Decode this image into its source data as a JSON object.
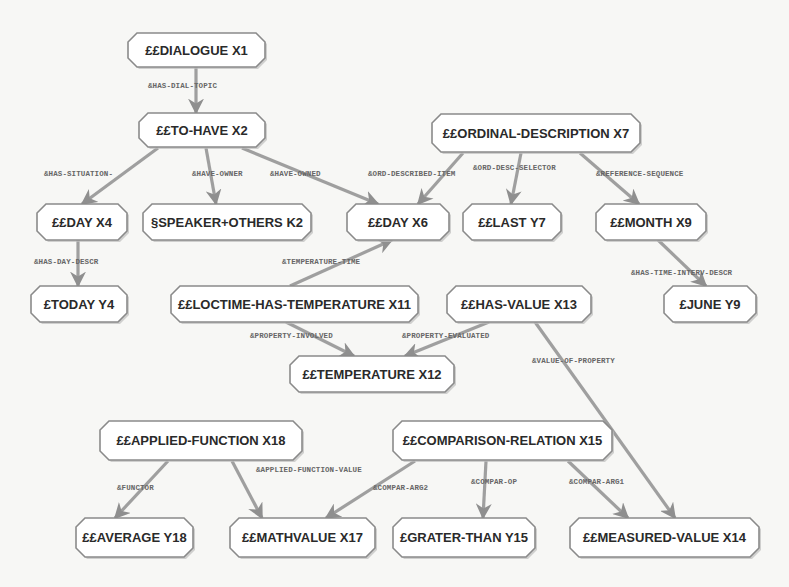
{
  "diagram": {
    "colors": {
      "background": "#f7f7f5",
      "node_fill": "#ffffff",
      "node_border": "#8a8a8a",
      "node_shadow": "#bdbdbd",
      "edge": "#8f8f8f",
      "node_text": "#2a2a2a",
      "edge_label_text": "#666666"
    },
    "nodes": [
      {
        "id": "X1",
        "label": "££DIALOGUE X1",
        "x": 128,
        "y": 33,
        "w": 137,
        "h": 34
      },
      {
        "id": "X2",
        "label": "££TO-HAVE X2",
        "x": 139,
        "y": 113,
        "w": 126,
        "h": 34
      },
      {
        "id": "X7",
        "label": "££ORDINAL-DESCRIPTION X7",
        "x": 432,
        "y": 114,
        "w": 208,
        "h": 38
      },
      {
        "id": "X4",
        "label": "££DAY X4",
        "x": 37,
        "y": 204,
        "w": 90,
        "h": 36
      },
      {
        "id": "K2",
        "label": "§SPEAKER+OTHERS K2",
        "x": 143,
        "y": 204,
        "w": 168,
        "h": 36
      },
      {
        "id": "X6",
        "label": "££DAY X6",
        "x": 347,
        "y": 204,
        "w": 102,
        "h": 36
      },
      {
        "id": "Y7",
        "label": "££LAST Y7",
        "x": 463,
        "y": 204,
        "w": 98,
        "h": 36
      },
      {
        "id": "X9",
        "label": "££MONTH X9",
        "x": 596,
        "y": 204,
        "w": 110,
        "h": 36
      },
      {
        "id": "Y4",
        "label": "£TODAY Y4",
        "x": 31,
        "y": 286,
        "w": 96,
        "h": 36
      },
      {
        "id": "X11",
        "label": "££LOCTIME-HAS-TEMPERATURE X11",
        "x": 171,
        "y": 286,
        "w": 247,
        "h": 36
      },
      {
        "id": "X13",
        "label": "££HAS-VALUE X13",
        "x": 447,
        "y": 286,
        "w": 144,
        "h": 36
      },
      {
        "id": "Y9",
        "label": "£JUNE Y9",
        "x": 664,
        "y": 286,
        "w": 92,
        "h": 36
      },
      {
        "id": "X12",
        "label": "££TEMPERATURE X12",
        "x": 290,
        "y": 356,
        "w": 164,
        "h": 36
      },
      {
        "id": "X18",
        "label": "££APPLIED-FUNCTION X18",
        "x": 100,
        "y": 421,
        "w": 202,
        "h": 39
      },
      {
        "id": "X15",
        "label": "££COMPARISON-RELATION X15",
        "x": 393,
        "y": 421,
        "w": 219,
        "h": 39
      },
      {
        "id": "Y18",
        "label": "££AVERAGE Y18",
        "x": 76,
        "y": 518,
        "w": 117,
        "h": 39
      },
      {
        "id": "X17",
        "label": "££MATHVALUE X17",
        "x": 230,
        "y": 518,
        "w": 145,
        "h": 39
      },
      {
        "id": "Y15",
        "label": "£GRATER-THAN Y15",
        "x": 393,
        "y": 518,
        "w": 142,
        "h": 39
      },
      {
        "id": "X14",
        "label": "££MEASURED-VALUE X14",
        "x": 570,
        "y": 518,
        "w": 189,
        "h": 39
      }
    ],
    "edges": [
      {
        "from": "X1",
        "to": "X2",
        "label": "&HAS-DIAL-TOPIC",
        "x1": 196,
        "y1": 67,
        "x2": 196,
        "y2": 113,
        "lx": 148,
        "ly": 82
      },
      {
        "from": "X2",
        "to": "X4",
        "label": "&HAS-SITUATION-",
        "x1": 158,
        "y1": 148,
        "x2": 82,
        "y2": 204,
        "lx": 44,
        "ly": 170
      },
      {
        "from": "X2",
        "to": "K2",
        "label": "&HAVE-OWNER",
        "x1": 206,
        "y1": 148,
        "x2": 216,
        "y2": 204,
        "lx": 192,
        "ly": 170
      },
      {
        "from": "X2",
        "to": "X6",
        "label": "&HAVE-OWNED",
        "x1": 242,
        "y1": 148,
        "x2": 378,
        "y2": 204,
        "lx": 270,
        "ly": 170
      },
      {
        "from": "X7",
        "to": "X6",
        "label": "&ORD-DESCRIBED-ITEM",
        "x1": 463,
        "y1": 153,
        "x2": 418,
        "y2": 204,
        "lx": 368,
        "ly": 170
      },
      {
        "from": "X7",
        "to": "Y7",
        "label": "&ORD-DESC-SELECTOR",
        "x1": 521,
        "y1": 153,
        "x2": 511,
        "y2": 204,
        "lx": 473,
        "ly": 164
      },
      {
        "from": "X7",
        "to": "X9",
        "label": "&REFERENCE-SEQUENCE",
        "x1": 580,
        "y1": 153,
        "x2": 639,
        "y2": 204,
        "lx": 596,
        "ly": 170
      },
      {
        "from": "X4",
        "to": "Y4",
        "label": "&HAS-DAY-DESCR",
        "x1": 78,
        "y1": 240,
        "x2": 78,
        "y2": 286,
        "lx": 34,
        "ly": 258
      },
      {
        "from": "X11",
        "to": "X6",
        "label": "&TEMPERATURE-TIME",
        "x1": 290,
        "y1": 286,
        "x2": 392,
        "y2": 240,
        "lx": 282,
        "ly": 258
      },
      {
        "from": "X9",
        "to": "Y9",
        "label": "&HAS-TIME-INTERV-DESCR",
        "x1": 658,
        "y1": 240,
        "x2": 706,
        "y2": 286,
        "lx": 631,
        "ly": 269
      },
      {
        "from": "X11",
        "to": "X12",
        "label": "&PROPERTY-INVOLVED",
        "x1": 286,
        "y1": 322,
        "x2": 354,
        "y2": 356,
        "lx": 250,
        "ly": 332
      },
      {
        "from": "X13",
        "to": "X12",
        "label": "&PROPERTY-EVALUATED",
        "x1": 489,
        "y1": 322,
        "x2": 405,
        "y2": 356,
        "lx": 402,
        "ly": 332
      },
      {
        "from": "X13",
        "to": "X14",
        "label": "&VALUE-OF-PROPERTY",
        "x1": 535,
        "y1": 322,
        "x2": 675,
        "y2": 518,
        "lx": 532,
        "ly": 357
      },
      {
        "from": "X18",
        "to": "Y18",
        "label": "&FUNCTOR",
        "x1": 168,
        "y1": 461,
        "x2": 115,
        "y2": 518,
        "lx": 117,
        "ly": 484
      },
      {
        "from": "X18",
        "to": "X17",
        "label": "&APPLIED-FUNCTION-VALUE",
        "x1": 232,
        "y1": 461,
        "x2": 262,
        "y2": 518,
        "lx": 256,
        "ly": 466
      },
      {
        "from": "X15",
        "to": "X17",
        "label": "&COMPAR-ARG2",
        "x1": 415,
        "y1": 461,
        "x2": 326,
        "y2": 518,
        "lx": 373,
        "ly": 484
      },
      {
        "from": "X15",
        "to": "Y15",
        "label": "&COMPAR-OP",
        "x1": 486,
        "y1": 461,
        "x2": 483,
        "y2": 518,
        "lx": 471,
        "ly": 478
      },
      {
        "from": "X15",
        "to": "X14",
        "label": "&COMPAR-ARG1",
        "x1": 568,
        "y1": 461,
        "x2": 628,
        "y2": 518,
        "lx": 569,
        "ly": 478
      }
    ]
  }
}
